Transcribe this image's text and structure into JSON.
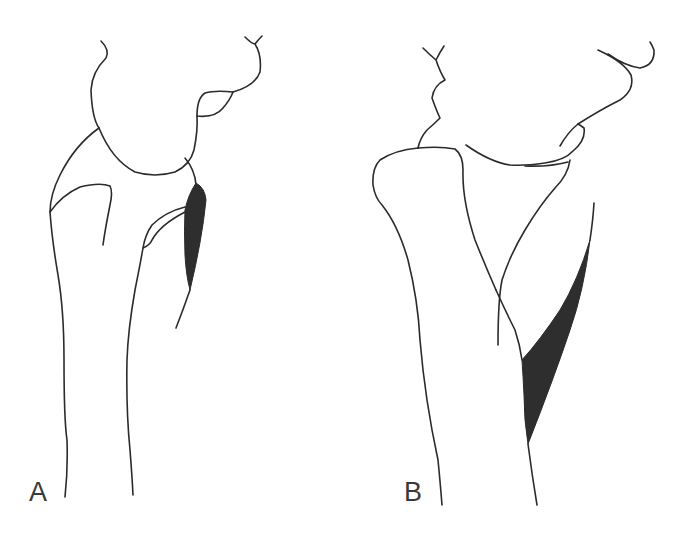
{
  "figure": {
    "panels": [
      {
        "id": "A",
        "label": "A",
        "shaded_region_color": "#2e2e2e"
      },
      {
        "id": "B",
        "label": "B",
        "shaded_region_color": "#2e2e2e"
      }
    ],
    "line_color": "#2b2b2b",
    "background": "#ffffff"
  }
}
